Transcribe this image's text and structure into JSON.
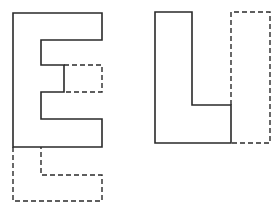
{
  "figure": {
    "width": 279,
    "height": 212,
    "stroke_color": "#2a2a2a",
    "background": "#ffffff",
    "shapes": [
      {
        "id": "letter-e",
        "label": "E",
        "style": "solid",
        "points": "13,13 102,13 102,40 41,40 41,65 64,65 64,92 41,92 41,119 102,119 102,147 13,147"
      },
      {
        "id": "e-missing-middle-piece",
        "style": "dashed",
        "points": "64,65 102,65 102,92 64,92"
      },
      {
        "id": "e-missing-bottom-l-piece",
        "style": "dashed",
        "points": "13,147 13,201 102,201 102,175 41,175 41,147"
      },
      {
        "id": "letter-l",
        "label": "L",
        "style": "solid",
        "points": "155,12 192,12 192,105 231,105 231,143 155,143"
      },
      {
        "id": "l-missing-bar-piece",
        "style": "dashed",
        "points": "231,105 231,12 270,12 270,143 231,143"
      }
    ]
  }
}
